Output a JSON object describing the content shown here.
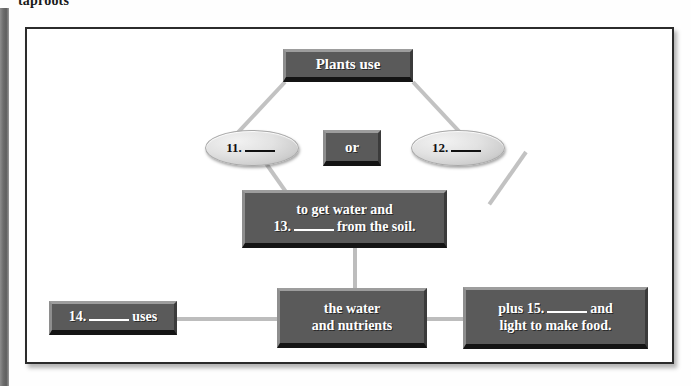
{
  "page": {
    "caption": "taproots"
  },
  "diagram": {
    "colors": {
      "box_face": "#5a5a5a",
      "box_highlight": "#9d9d9d",
      "box_shadow": "#141414",
      "ellipse_face": "#e2e2e2",
      "connector": "#bdbdbd",
      "frame_border": "#2b2b2b",
      "text_on_box": "#ffffff",
      "text_on_ellipse": "#111111"
    },
    "nodes": {
      "plants_use": {
        "label": "Plants use"
      },
      "option_left": {
        "number": "11.",
        "blank": "____"
      },
      "or": {
        "label": "or"
      },
      "option_right": {
        "number": "12.",
        "blank": "____"
      },
      "soil": {
        "line1": "to get water and",
        "line2_pre": "13.",
        "line2_blank": "____",
        "line2_post": "from the soil."
      },
      "uses": {
        "pre": "14.",
        "blank": "____",
        "post": "uses"
      },
      "water_nutrients": {
        "line1": "the water",
        "line2": "and nutrients"
      },
      "plus_light": {
        "line1_pre": "plus 15.",
        "line1_blank": "____",
        "line1_post": "and",
        "line2": "light to make food."
      }
    }
  }
}
